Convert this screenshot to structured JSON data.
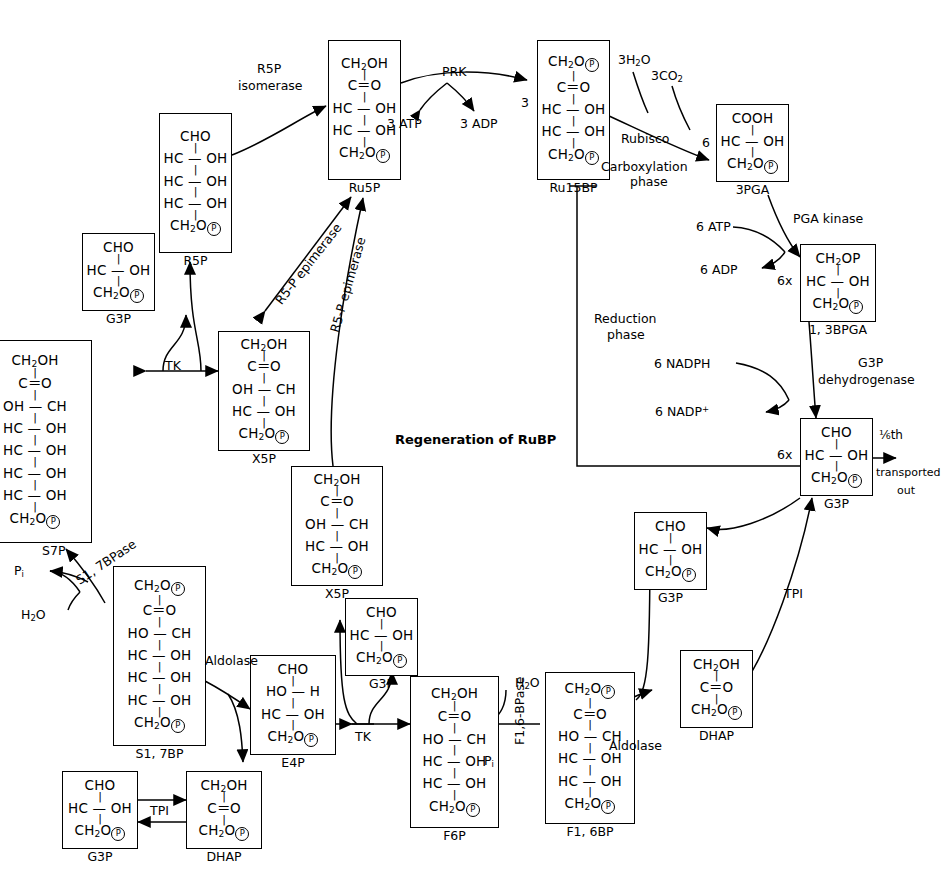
{
  "phases": {
    "carboxylation": "Carboxylation\nphase",
    "carboxylation_line1": "Carboxylation",
    "carboxylation_line2": "phase",
    "reduction_line1": "Reduction",
    "reduction_line2": "phase",
    "regeneration": "Regeneration of RuBP"
  },
  "molecules": [
    {
      "id": "ru5p",
      "name": "Ru5P",
      "rows": [
        "CH₂OH",
        "C＝O",
        "HC — OH",
        "HC — OH",
        "CH₂OⓅ"
      ]
    },
    {
      "id": "ru15bp",
      "name": "Ru15BP",
      "rows": [
        "CH₂OⓅ",
        "C＝O",
        "HC — OH",
        "HC — OH",
        "CH₂OⓅ"
      ]
    },
    {
      "id": "3pga",
      "name": "3PGA",
      "rows": [
        "COOH",
        "HC — OH",
        "CH₂OⓅ"
      ]
    },
    {
      "id": "13bpga",
      "name": "1, 3BPGA",
      "rows": [
        "CH₂OP",
        "HC — OH",
        "CH₂OⓅ"
      ]
    },
    {
      "id": "g3p_right",
      "name": "G3P",
      "rows": [
        "CHO",
        "HC — OH",
        "CH₂OⓅ"
      ]
    },
    {
      "id": "r5p",
      "name": "R5P",
      "rows": [
        "CHO",
        "HC — OH",
        "HC — OH",
        "HC — OH",
        "CH₂OⓅ"
      ]
    },
    {
      "id": "g3p_topleft",
      "name": "G3P",
      "rows": [
        "CHO",
        "HC — OH",
        "CH₂OⓅ"
      ]
    },
    {
      "id": "x5p_upper",
      "name": "X5P",
      "rows": [
        "CH₂OH",
        "C＝O",
        "OH — CH",
        "HC — OH",
        "CH₂OⓅ"
      ]
    },
    {
      "id": "x5p_mid",
      "name": "X5P",
      "rows": [
        "CH₂OH",
        "C＝O",
        "OH — CH",
        "HC — OH",
        "CH₂OⓅ"
      ]
    },
    {
      "id": "s7p",
      "name": "S7P",
      "rows": [
        "CH₂OH",
        "C＝O",
        "OH — CH",
        "HC — OH",
        "HC — OH",
        "HC — OH",
        "HC — OH",
        "CH₂OⓅ"
      ]
    },
    {
      "id": "s17bp",
      "name": "S1, 7BP",
      "rows": [
        "CH₂OⓅ",
        "C＝O",
        "HO — CH",
        "HC — OH",
        "HC — OH",
        "HC — OH",
        "CH₂OⓅ"
      ]
    },
    {
      "id": "e4p",
      "name": "E4P",
      "rows": [
        "CHO",
        "HO — H",
        "HC — OH",
        "CH₂OⓅ"
      ]
    },
    {
      "id": "g3p_lowmid",
      "name": "G3P",
      "rows": [
        "CHO",
        "HC — OH",
        "CH₂OⓅ"
      ]
    },
    {
      "id": "f6p",
      "name": "F6P",
      "rows": [
        "CH₂OH",
        "C＝O",
        "HO — CH",
        "HC — OH",
        "HC — OH",
        "CH₂OⓅ"
      ]
    },
    {
      "id": "f16bp",
      "name": "F1, 6BP",
      "rows": [
        "CH₂OⓅ",
        "C＝O",
        "HO — CH",
        "HC — OH",
        "HC — OH",
        "CH₂OⓅ"
      ]
    },
    {
      "id": "g3p_bottomleft",
      "name": "G3P",
      "rows": [
        "CHO",
        "HC — OH",
        "CH₂OⓅ"
      ]
    },
    {
      "id": "dhap_bottomleft",
      "name": "DHAP",
      "rows": [
        "CH₂OH",
        "C＝O",
        "CH₂OⓅ"
      ]
    },
    {
      "id": "g3p_rightmid",
      "name": "G3P",
      "rows": [
        "CHO",
        "HC — OH",
        "CH₂OⓅ"
      ]
    },
    {
      "id": "dhap_right",
      "name": "DHAP",
      "rows": [
        "CH₂OH",
        "C＝O",
        "CH₂OⓅ"
      ]
    }
  ],
  "enzymes": {
    "prk": "PRK",
    "rubisco": "Rubisco",
    "pga_kinase": "PGA kinase",
    "g3p_dehydrogenase_l1": "G3P",
    "g3p_dehydrogenase_l2": "dehydrogenase",
    "r5p_isomerase_l1": "R5P",
    "r5p_isomerase_l2": "isomerase",
    "r5p_epimerase_a": "R5-P epimerase",
    "r5p_epimerase_b": "R5-P epimerase",
    "tk_upper": "TK",
    "tk_lower": "TK",
    "aldolase_left": "Aldolase",
    "aldolase_right": "Aldolase",
    "tpi_bottom": "TPI",
    "tpi_right": "TPI",
    "sbpase": "S1, 7BPase",
    "fbpase": "F1,6-BPase"
  },
  "cofactors": {
    "atp_3": "3 ATP",
    "adp_3": "3 ADP",
    "h2o_3": "3H₂O",
    "co2_3": "3CO₂",
    "atp_6": "6 ATP",
    "adp_6": "6 ADP",
    "nadph_6": "6 NADPH",
    "nadp_6": "6 NADP⁺",
    "h2o_left": "H₂O",
    "h2o_right": "H₂O",
    "pi_left": "Pᵢ",
    "pi_right": "Pᵢ"
  },
  "stoichiometry": {
    "three_into_ru15bp": "3",
    "six_into_3pga": "6",
    "sixx_13bpga": "6x",
    "sixx_g3p": "6x",
    "export_fraction": "⅙th",
    "export_line1": "transported",
    "export_line2": "out"
  },
  "colors": {
    "ink": "#000000",
    "paper": "#ffffff"
  }
}
